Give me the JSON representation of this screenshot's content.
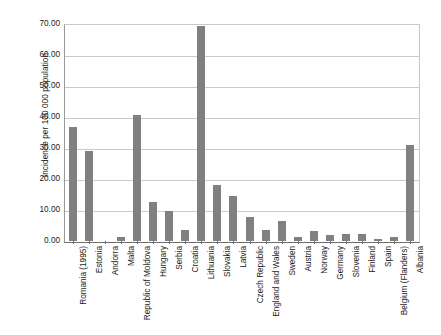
{
  "chart_data": {
    "type": "bar",
    "title": "",
    "xlabel": "",
    "ylabel": "Incidence per 100 000 population",
    "ylim": [
      0,
      70
    ],
    "ytick_labels": [
      "70.00",
      "60.00",
      "50.00",
      "40.00",
      "30.00",
      "20.00",
      "10.00",
      "0.00"
    ],
    "ytick_values": [
      70,
      60,
      50,
      40,
      30,
      20,
      10,
      0
    ],
    "grid": true,
    "legend": "none",
    "bar_color": "#808080",
    "categories": [
      "Romania (1995)",
      "Estonia",
      "Andorra",
      "Malta",
      "Republic of Moldova",
      "Hungary",
      "Serbia",
      "Croatia",
      "Lithuania",
      "Slovakia",
      "Latvia",
      "Czech Republic",
      "England and Wales",
      "Sweden",
      "Austria",
      "Norway",
      "Germany",
      "Slovenia",
      "Finland",
      "Spain",
      "Belgium (Flanders)",
      "Albania"
    ],
    "values": [
      36.8,
      29.0,
      0.0,
      1.2,
      40.8,
      12.6,
      9.6,
      3.5,
      69.3,
      18.1,
      14.6,
      7.8,
      3.5,
      6.3,
      1.4,
      3.2,
      1.8,
      2.2,
      2.3,
      0.5,
      1.2,
      31.0
    ]
  }
}
